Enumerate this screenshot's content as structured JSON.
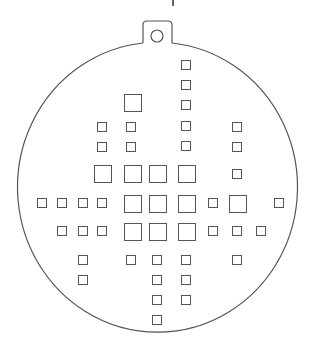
{
  "diagram": {
    "type": "ornament-template",
    "stroke_color": "#555555",
    "background": "#ffffff",
    "outline": {
      "cx": 157,
      "cy": 188,
      "rx": 140,
      "ry": 145
    },
    "hanger_tab": {
      "x1": 143,
      "x2": 172,
      "top": 21,
      "join_y": 43,
      "hole": {
        "cx": 157,
        "cy": 36,
        "r": 6
      }
    },
    "top_mark": {
      "x": 173,
      "y1": 0,
      "y2": 6
    },
    "squares": [
      {
        "x": 181,
        "y": 60,
        "s": 10
      },
      {
        "x": 181,
        "y": 80,
        "s": 10
      },
      {
        "x": 124,
        "y": 94,
        "s": 18
      },
      {
        "x": 181,
        "y": 100,
        "s": 10
      },
      {
        "x": 97,
        "y": 122,
        "s": 10
      },
      {
        "x": 126,
        "y": 122,
        "s": 10
      },
      {
        "x": 181,
        "y": 121,
        "s": 10
      },
      {
        "x": 232,
        "y": 122,
        "s": 10
      },
      {
        "x": 97,
        "y": 142,
        "s": 10
      },
      {
        "x": 126,
        "y": 142,
        "s": 10
      },
      {
        "x": 181,
        "y": 141,
        "s": 10
      },
      {
        "x": 232,
        "y": 142,
        "s": 10
      },
      {
        "x": 94,
        "y": 165,
        "s": 18
      },
      {
        "x": 124,
        "y": 165,
        "s": 18
      },
      {
        "x": 149,
        "y": 165,
        "s": 18
      },
      {
        "x": 178,
        "y": 165,
        "s": 18
      },
      {
        "x": 232,
        "y": 169,
        "s": 10
      },
      {
        "x": 37,
        "y": 198,
        "s": 10
      },
      {
        "x": 57,
        "y": 198,
        "s": 10
      },
      {
        "x": 78,
        "y": 198,
        "s": 10
      },
      {
        "x": 97,
        "y": 198,
        "s": 10
      },
      {
        "x": 124,
        "y": 195,
        "s": 18
      },
      {
        "x": 149,
        "y": 195,
        "s": 18
      },
      {
        "x": 178,
        "y": 195,
        "s": 18
      },
      {
        "x": 208,
        "y": 198,
        "s": 10
      },
      {
        "x": 229,
        "y": 195,
        "s": 18
      },
      {
        "x": 274,
        "y": 198,
        "s": 10
      },
      {
        "x": 57,
        "y": 226,
        "s": 10
      },
      {
        "x": 78,
        "y": 226,
        "s": 10
      },
      {
        "x": 97,
        "y": 226,
        "s": 10
      },
      {
        "x": 124,
        "y": 223,
        "s": 18
      },
      {
        "x": 149,
        "y": 223,
        "s": 18
      },
      {
        "x": 178,
        "y": 223,
        "s": 18
      },
      {
        "x": 208,
        "y": 226,
        "s": 10
      },
      {
        "x": 232,
        "y": 226,
        "s": 10
      },
      {
        "x": 256,
        "y": 226,
        "s": 10
      },
      {
        "x": 78,
        "y": 255,
        "s": 10
      },
      {
        "x": 126,
        "y": 255,
        "s": 10
      },
      {
        "x": 152,
        "y": 255,
        "s": 10
      },
      {
        "x": 181,
        "y": 255,
        "s": 10
      },
      {
        "x": 232,
        "y": 255,
        "s": 10
      },
      {
        "x": 78,
        "y": 275,
        "s": 10
      },
      {
        "x": 152,
        "y": 275,
        "s": 10
      },
      {
        "x": 181,
        "y": 275,
        "s": 10
      },
      {
        "x": 152,
        "y": 295,
        "s": 10
      },
      {
        "x": 181,
        "y": 295,
        "s": 10
      },
      {
        "x": 152,
        "y": 315,
        "s": 10
      }
    ]
  }
}
